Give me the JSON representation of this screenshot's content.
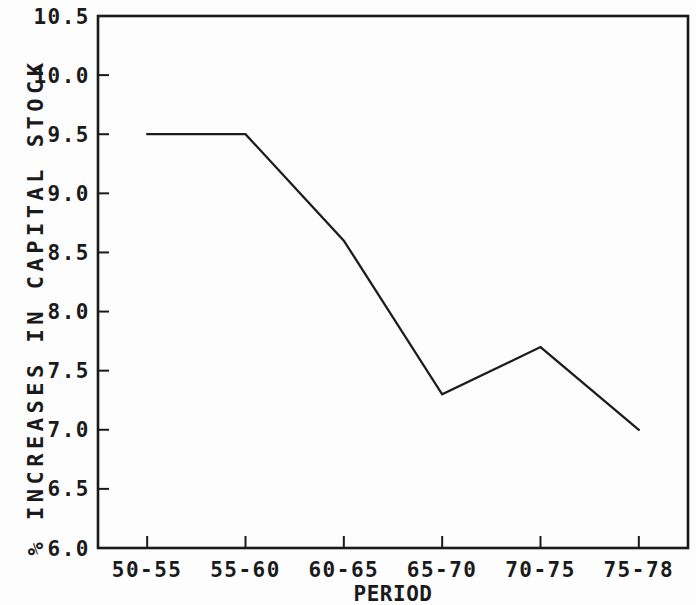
{
  "figure": {
    "title": "",
    "xlabel": "PERIOD",
    "ylabel": "% INCREASES IN CAPITAL STOCK"
  },
  "colors": {
    "line": "#1c1c1c",
    "axis": "#1a1a1a",
    "text": "#1a1a1a",
    "background": "#fdfdfd"
  },
  "chart_data": {
    "type": "line",
    "categories": [
      "50-55",
      "55-60",
      "60-65",
      "65-70",
      "70-75",
      "75-78"
    ],
    "values": [
      9.5,
      9.5,
      8.6,
      7.3,
      7.7,
      7.0
    ],
    "title": "",
    "xlabel": "PERIOD",
    "ylabel": "% INCREASES IN CAPITAL STOCK",
    "ylim": [
      6.0,
      10.5
    ],
    "ytick_step": 0.5,
    "ytick_labels": [
      "6.0",
      "6.5",
      "7.0",
      "7.5",
      "8.0",
      "8.5",
      "9.0",
      "9.5",
      "10.0",
      "10.5"
    ],
    "grid": false,
    "legend": "none",
    "marker": "none"
  }
}
